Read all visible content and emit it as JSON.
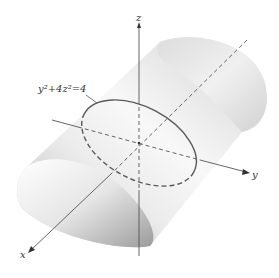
{
  "figure": {
    "equation_label": "y²+4z²=4",
    "axes": {
      "x": {
        "label": "x"
      },
      "y": {
        "label": "y"
      },
      "z": {
        "label": "z"
      }
    },
    "colors": {
      "surface_light": "#f4f4f4",
      "surface_mid": "#d8d8d8",
      "surface_dark": "#a8a8a8",
      "axis": "#555555",
      "ellipse": "#5a5a5a"
    }
  }
}
